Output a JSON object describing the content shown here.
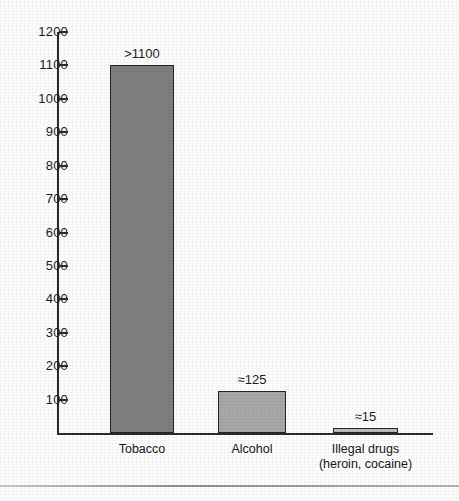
{
  "chart_data": {
    "type": "bar",
    "title": "",
    "subtitle": "",
    "xlabel": "",
    "ylabel": "",
    "ylim": [
      0,
      1200
    ],
    "ytick_step": 100,
    "grid": false,
    "legend": "none",
    "categories": [
      "Tobacco",
      "Alcohol",
      "Illegal drugs"
    ],
    "category_sublabels": [
      "",
      "",
      "(heroin, cocaine)"
    ],
    "values": [
      1100,
      125,
      15
    ],
    "value_labels": [
      ">1100",
      "≈125",
      "≈15"
    ],
    "bar_colors": [
      "#7f7f7f",
      "#a8a8a8",
      "#bdbdbd"
    ],
    "bar_border_color": "#242424",
    "axis_color": "#2b2b2b",
    "yticks": [
      {
        "value": 1200,
        "label": "1200"
      },
      {
        "value": 1100,
        "label": "1100"
      },
      {
        "value": 1000,
        "label": "1000"
      },
      {
        "value": 900,
        "label": "900"
      },
      {
        "value": 800,
        "label": "800"
      },
      {
        "value": 700,
        "label": "700"
      },
      {
        "value": 600,
        "label": "600"
      },
      {
        "value": 500,
        "label": "500"
      },
      {
        "value": 400,
        "label": "400"
      },
      {
        "value": 300,
        "label": "300"
      },
      {
        "value": 200,
        "label": "200"
      },
      {
        "value": 100,
        "label": "100"
      }
    ]
  },
  "footer": {
    "caption": ""
  }
}
